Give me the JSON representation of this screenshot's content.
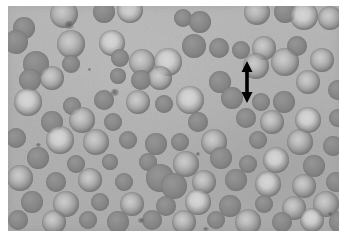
{
  "figure": {
    "kind": "photomicrograph",
    "stain_appearance": "grayscale",
    "frame": {
      "left": 8,
      "top": 6,
      "width": 331,
      "height": 225
    },
    "page_background_color": "#ffffff",
    "field_background_color": "#b5b5b5",
    "cell_rim_color": "#7d7d7d",
    "cell_pallor_color": "#d2d2d2",
    "annotation_color": "#000000"
  },
  "annotation": {
    "name": "double-headed-arrow",
    "label": "",
    "orientation": "vertical",
    "x": 231,
    "y": 55,
    "width": 16,
    "height": 42,
    "color": "#000000"
  },
  "cells": [
    {
      "x": 56,
      "y": 8,
      "r": 14,
      "type": "disc"
    },
    {
      "x": 96,
      "y": 6,
      "r": 11,
      "type": "sphero"
    },
    {
      "x": 122,
      "y": 4,
      "r": 13,
      "type": "pale"
    },
    {
      "x": 16,
      "y": 22,
      "r": 11,
      "type": "sphero"
    },
    {
      "x": 175,
      "y": 12,
      "r": 9,
      "type": "sphero"
    },
    {
      "x": 192,
      "y": 16,
      "r": 11,
      "type": "sphero"
    },
    {
      "x": 249,
      "y": 6,
      "r": 13,
      "type": "disc"
    },
    {
      "x": 277,
      "y": 6,
      "r": 11,
      "type": "sphero"
    },
    {
      "x": 296,
      "y": 10,
      "r": 14,
      "type": "pale"
    },
    {
      "x": 322,
      "y": 12,
      "r": 12,
      "type": "disc"
    },
    {
      "x": 8,
      "y": 36,
      "r": 12,
      "type": "sphero"
    },
    {
      "x": 63,
      "y": 38,
      "r": 14,
      "type": "disc"
    },
    {
      "x": 104,
      "y": 37,
      "r": 13,
      "type": "pale"
    },
    {
      "x": 186,
      "y": 40,
      "r": 12,
      "type": "sphero"
    },
    {
      "x": 211,
      "y": 42,
      "r": 10,
      "type": "sphero"
    },
    {
      "x": 233,
      "y": 44,
      "r": 9,
      "type": "sphero"
    },
    {
      "x": 256,
      "y": 42,
      "r": 12,
      "type": "disc"
    },
    {
      "x": 289,
      "y": 40,
      "r": 10,
      "type": "sphero"
    },
    {
      "x": 28,
      "y": 58,
      "r": 13,
      "type": "sphero"
    },
    {
      "x": 63,
      "y": 58,
      "r": 9,
      "type": "sphero"
    },
    {
      "x": 112,
      "y": 52,
      "r": 9,
      "type": "sphero"
    },
    {
      "x": 134,
      "y": 56,
      "r": 13,
      "type": "disc"
    },
    {
      "x": 160,
      "y": 56,
      "r": 14,
      "type": "pale"
    },
    {
      "x": 248,
      "y": 60,
      "r": 13,
      "type": "disc"
    },
    {
      "x": 277,
      "y": 56,
      "r": 14,
      "type": "disc"
    },
    {
      "x": 314,
      "y": 54,
      "r": 12,
      "type": "disc"
    },
    {
      "x": 22,
      "y": 74,
      "r": 11,
      "type": "sphero"
    },
    {
      "x": 44,
      "y": 72,
      "r": 12,
      "type": "disc"
    },
    {
      "x": 110,
      "y": 70,
      "r": 8,
      "type": "sphero"
    },
    {
      "x": 133,
      "y": 74,
      "r": 10,
      "type": "sphero"
    },
    {
      "x": 152,
      "y": 72,
      "r": 12,
      "type": "disc"
    },
    {
      "x": 212,
      "y": 76,
      "r": 11,
      "type": "sphero"
    },
    {
      "x": 300,
      "y": 76,
      "r": 12,
      "type": "disc"
    },
    {
      "x": 330,
      "y": 84,
      "r": 10,
      "type": "sphero"
    },
    {
      "x": 20,
      "y": 96,
      "r": 14,
      "type": "pale"
    },
    {
      "x": 64,
      "y": 100,
      "r": 9,
      "type": "sphero"
    },
    {
      "x": 96,
      "y": 94,
      "r": 10,
      "type": "sphero"
    },
    {
      "x": 130,
      "y": 96,
      "r": 12,
      "type": "disc"
    },
    {
      "x": 156,
      "y": 98,
      "r": 9,
      "type": "sphero"
    },
    {
      "x": 182,
      "y": 94,
      "r": 14,
      "type": "pale"
    },
    {
      "x": 224,
      "y": 92,
      "r": 11,
      "type": "sphero"
    },
    {
      "x": 253,
      "y": 96,
      "r": 9,
      "type": "sphero"
    },
    {
      "x": 276,
      "y": 96,
      "r": 11,
      "type": "sphero"
    },
    {
      "x": 44,
      "y": 116,
      "r": 11,
      "type": "sphero"
    },
    {
      "x": 74,
      "y": 114,
      "r": 13,
      "type": "disc"
    },
    {
      "x": 105,
      "y": 116,
      "r": 9,
      "type": "sphero"
    },
    {
      "x": 190,
      "y": 116,
      "r": 10,
      "type": "sphero"
    },
    {
      "x": 238,
      "y": 112,
      "r": 10,
      "type": "sphero"
    },
    {
      "x": 264,
      "y": 116,
      "r": 12,
      "type": "disc"
    },
    {
      "x": 300,
      "y": 114,
      "r": 13,
      "type": "pale"
    },
    {
      "x": 330,
      "y": 112,
      "r": 9,
      "type": "sphero"
    },
    {
      "x": 8,
      "y": 132,
      "r": 10,
      "type": "sphero"
    },
    {
      "x": 52,
      "y": 134,
      "r": 14,
      "type": "pale"
    },
    {
      "x": 88,
      "y": 136,
      "r": 13,
      "type": "disc"
    },
    {
      "x": 120,
      "y": 134,
      "r": 9,
      "type": "sphero"
    },
    {
      "x": 148,
      "y": 138,
      "r": 11,
      "type": "sphero"
    },
    {
      "x": 172,
      "y": 136,
      "r": 9,
      "type": "sphero"
    },
    {
      "x": 206,
      "y": 136,
      "r": 13,
      "type": "disc"
    },
    {
      "x": 250,
      "y": 134,
      "r": 9,
      "type": "sphero"
    },
    {
      "x": 292,
      "y": 136,
      "r": 13,
      "type": "disc"
    },
    {
      "x": 325,
      "y": 140,
      "r": 10,
      "type": "sphero"
    },
    {
      "x": 30,
      "y": 152,
      "r": 11,
      "type": "sphero"
    },
    {
      "x": 68,
      "y": 158,
      "r": 9,
      "type": "sphero"
    },
    {
      "x": 102,
      "y": 156,
      "r": 8,
      "type": "sphero"
    },
    {
      "x": 140,
      "y": 156,
      "r": 9,
      "type": "sphero"
    },
    {
      "x": 178,
      "y": 158,
      "r": 13,
      "type": "disc"
    },
    {
      "x": 213,
      "y": 152,
      "r": 11,
      "type": "sphero"
    },
    {
      "x": 240,
      "y": 158,
      "r": 9,
      "type": "sphero"
    },
    {
      "x": 268,
      "y": 154,
      "r": 13,
      "type": "pale"
    },
    {
      "x": 306,
      "y": 160,
      "r": 11,
      "type": "sphero"
    },
    {
      "x": 12,
      "y": 172,
      "r": 13,
      "type": "disc"
    },
    {
      "x": 48,
      "y": 176,
      "r": 10,
      "type": "sphero"
    },
    {
      "x": 82,
      "y": 174,
      "r": 12,
      "type": "disc"
    },
    {
      "x": 116,
      "y": 176,
      "r": 9,
      "type": "sphero"
    },
    {
      "x": 152,
      "y": 172,
      "r": 14,
      "type": "sphero"
    },
    {
      "x": 166,
      "y": 180,
      "r": 13,
      "type": "sphero"
    },
    {
      "x": 196,
      "y": 176,
      "r": 12,
      "type": "disc"
    },
    {
      "x": 228,
      "y": 174,
      "r": 11,
      "type": "sphero"
    },
    {
      "x": 260,
      "y": 178,
      "r": 13,
      "type": "pale"
    },
    {
      "x": 296,
      "y": 180,
      "r": 12,
      "type": "disc"
    },
    {
      "x": 328,
      "y": 176,
      "r": 10,
      "type": "sphero"
    },
    {
      "x": 24,
      "y": 196,
      "r": 11,
      "type": "sphero"
    },
    {
      "x": 58,
      "y": 198,
      "r": 13,
      "type": "disc"
    },
    {
      "x": 92,
      "y": 196,
      "r": 9,
      "type": "sphero"
    },
    {
      "x": 124,
      "y": 198,
      "r": 12,
      "type": "disc"
    },
    {
      "x": 158,
      "y": 200,
      "r": 10,
      "type": "sphero"
    },
    {
      "x": 190,
      "y": 196,
      "r": 13,
      "type": "pale"
    },
    {
      "x": 222,
      "y": 200,
      "r": 11,
      "type": "sphero"
    },
    {
      "x": 256,
      "y": 198,
      "r": 9,
      "type": "sphero"
    },
    {
      "x": 286,
      "y": 202,
      "r": 12,
      "type": "disc"
    },
    {
      "x": 318,
      "y": 198,
      "r": 13,
      "type": "disc"
    },
    {
      "x": 10,
      "y": 214,
      "r": 10,
      "type": "sphero"
    },
    {
      "x": 46,
      "y": 216,
      "r": 12,
      "type": "disc"
    },
    {
      "x": 80,
      "y": 214,
      "r": 9,
      "type": "sphero"
    },
    {
      "x": 110,
      "y": 216,
      "r": 11,
      "type": "sphero"
    },
    {
      "x": 144,
      "y": 214,
      "r": 10,
      "type": "sphero"
    },
    {
      "x": 176,
      "y": 216,
      "r": 12,
      "type": "disc"
    },
    {
      "x": 208,
      "y": 214,
      "r": 9,
      "type": "sphero"
    },
    {
      "x": 240,
      "y": 216,
      "r": 13,
      "type": "disc"
    },
    {
      "x": 274,
      "y": 216,
      "r": 10,
      "type": "sphero"
    },
    {
      "x": 304,
      "y": 214,
      "r": 12,
      "type": "pale"
    },
    {
      "x": 332,
      "y": 216,
      "r": 11,
      "type": "sphero"
    }
  ],
  "artifacts": [
    {
      "x": 57,
      "y": 15,
      "w": 9,
      "h": 8
    },
    {
      "x": 103,
      "y": 83,
      "w": 8,
      "h": 7
    },
    {
      "x": 28,
      "y": 137,
      "w": 5,
      "h": 4
    },
    {
      "x": 80,
      "y": 62,
      "w": 3,
      "h": 3
    },
    {
      "x": 188,
      "y": 146,
      "w": 4,
      "h": 4
    },
    {
      "x": 130,
      "y": 212,
      "w": 7,
      "h": 5
    },
    {
      "x": 195,
      "y": 221,
      "w": 6,
      "h": 4
    },
    {
      "x": 320,
      "y": 206,
      "w": 5,
      "h": 4
    }
  ]
}
